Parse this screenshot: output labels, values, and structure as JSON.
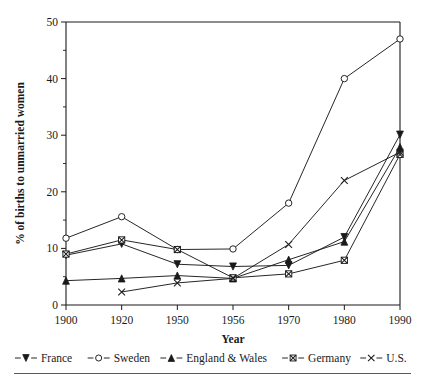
{
  "chart_data": {
    "type": "line",
    "title": "",
    "subtitle": "",
    "xlabel": "Year",
    "ylabel": "% of births to unmarried women",
    "categories": [
      "1900",
      "1920",
      "1950",
      "1956",
      "1970",
      "1980",
      "1990"
    ],
    "x": [
      1900,
      1920,
      1950,
      1956,
      1970,
      1980,
      1990
    ],
    "ylim": [
      0,
      50
    ],
    "yticks": [
      0,
      10,
      20,
      30,
      40,
      50
    ],
    "yticks_minor": [
      5,
      15,
      25,
      35,
      45
    ],
    "ytick_labels": [
      "0",
      "10",
      "20",
      "30",
      "40",
      "50"
    ],
    "xtick_labels": [
      "1900",
      "1920",
      "1950",
      "1956",
      "1970",
      "1980",
      "1990"
    ],
    "grid": false,
    "legend_position": "bottom",
    "axis_spacing": "categorical",
    "series": [
      {
        "name": "France",
        "marker": "filled-down-triangle",
        "color": "#1a1a1a",
        "values": [
          8.8,
          10.8,
          7.2,
          6.8,
          7.0,
          12.0,
          30.1
        ]
      },
      {
        "name": "Sweden",
        "marker": "open-circle",
        "color": "#1a1a1a",
        "values": [
          11.8,
          15.6,
          9.8,
          9.9,
          18.0,
          40.0,
          47.0
        ]
      },
      {
        "name": "England & Wales",
        "marker": "filled-up-triangle",
        "color": "#1a1a1a",
        "values": [
          4.3,
          4.7,
          5.2,
          4.7,
          8.0,
          11.2,
          27.9
        ]
      },
      {
        "name": "Germany",
        "marker": "open-square-x",
        "color": "#1a1a1a",
        "values": [
          9.0,
          11.5,
          9.8,
          4.8,
          5.5,
          7.9,
          26.6
        ]
      },
      {
        "name": "U.S.",
        "marker": "x",
        "color": "#1a1a1a",
        "values": [
          null,
          2.3,
          3.9,
          4.7,
          10.7,
          22.0,
          27.0
        ]
      }
    ]
  },
  "legend": {
    "items": [
      {
        "label": "France",
        "marker": "filled-down-triangle"
      },
      {
        "label": "Sweden",
        "marker": "open-circle"
      },
      {
        "label": "England & Wales",
        "marker": "filled-up-triangle"
      },
      {
        "label": "Germany",
        "marker": "open-square-x"
      },
      {
        "label": "U.S.",
        "marker": "x"
      }
    ]
  },
  "axes": {
    "x_title": "Year",
    "y_title": "% of births to unmarried women"
  }
}
